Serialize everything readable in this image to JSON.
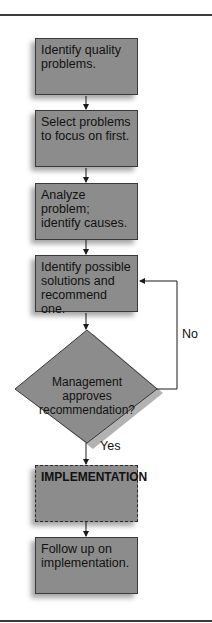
{
  "flowchart": {
    "steps": [
      {
        "label": "Identify quality problems."
      },
      {
        "label": "Select problems to focus on first."
      },
      {
        "label": "Analyze problem; identify causes."
      },
      {
        "label": "Identify possible solutions and recommend one."
      }
    ],
    "decision": {
      "label": "Management approves recommendation?"
    },
    "branches": {
      "yes": "Yes",
      "no": "No"
    },
    "implementation": {
      "label": "IMPLEMENTATION"
    },
    "followup": {
      "label": "Follow up on implementation."
    },
    "colors": {
      "box_fill": "#8c8c8c",
      "line": "#1a1a1a",
      "background": "#ffffff"
    }
  }
}
